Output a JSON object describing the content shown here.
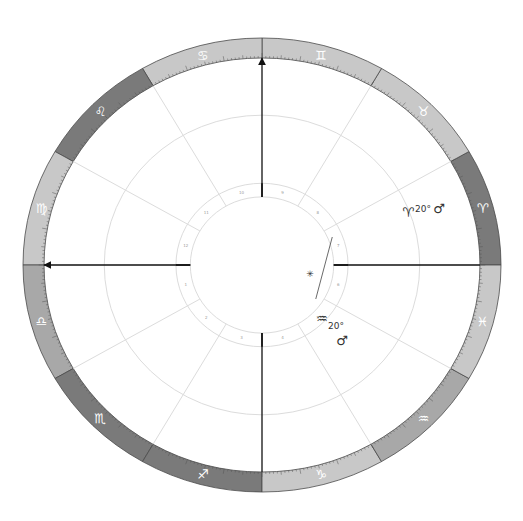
{
  "chart": {
    "center": {
      "x": 262,
      "y": 265
    },
    "outer_rx": 239,
    "outer_ry": 227,
    "ring_width": 20,
    "colors": {
      "light_sign": "#c8c8c8",
      "dark_sign": "#7a7a7a",
      "mid_sign": "#a8a8a8",
      "ring_border": "#4a4a4a",
      "house_line": "#dcdcdc",
      "circle_line": "#dcdcdc",
      "axis_line": "#111111",
      "glyph": "#ffffff"
    },
    "signs": [
      {
        "name": "Aries",
        "glyph": "♈",
        "start_deg": 0,
        "shade": "dark"
      },
      {
        "name": "Taurus",
        "glyph": "♉",
        "start_deg": 30,
        "shade": "light"
      },
      {
        "name": "Gemini",
        "glyph": "♊",
        "start_deg": 60,
        "shade": "light"
      },
      {
        "name": "Cancer",
        "glyph": "♋",
        "start_deg": 90,
        "shade": "light"
      },
      {
        "name": "Leo",
        "glyph": "♌",
        "start_deg": 120,
        "shade": "dark"
      },
      {
        "name": "Virgo",
        "glyph": "♍",
        "start_deg": 150,
        "shade": "light"
      },
      {
        "name": "Libra",
        "glyph": "♎",
        "start_deg": 180,
        "shade": "mid"
      },
      {
        "name": "Scorpio",
        "glyph": "♏",
        "start_deg": 210,
        "shade": "dark"
      },
      {
        "name": "Sagittarius",
        "glyph": "♐",
        "start_deg": 240,
        "shade": "dark"
      },
      {
        "name": "Capricorn",
        "glyph": "♑",
        "start_deg": 270,
        "shade": "light"
      },
      {
        "name": "Aquarius",
        "glyph": "♒",
        "start_deg": 300,
        "shade": "mid"
      },
      {
        "name": "Pisces",
        "glyph": "♓",
        "start_deg": 330,
        "shade": "light"
      }
    ],
    "houses": [
      {
        "num": "1",
        "deg": 180
      },
      {
        "num": "2",
        "deg": 210
      },
      {
        "num": "3",
        "deg": 240
      },
      {
        "num": "4",
        "deg": 270
      },
      {
        "num": "5",
        "deg": 300
      },
      {
        "num": "6",
        "deg": 330
      },
      {
        "num": "7",
        "deg": 0
      },
      {
        "num": "8",
        "deg": 30
      },
      {
        "num": "9",
        "deg": 60
      },
      {
        "num": "10",
        "deg": 90
      },
      {
        "num": "11",
        "deg": 120
      },
      {
        "num": "12",
        "deg": 150
      }
    ],
    "axes": [
      {
        "label": "MC",
        "deg": 90,
        "arrow": true
      },
      {
        "label": "ASC",
        "deg": 180,
        "arrow": true
      },
      {
        "label": "IC",
        "deg": 270,
        "arrow": false
      },
      {
        "label": "DSC",
        "deg": 0,
        "arrow": false
      }
    ],
    "planets": [
      {
        "name": "Mars",
        "sign_glyph": "♈",
        "degree": "20°",
        "planet_glyph": "♂",
        "x": 420,
        "y": 210
      },
      {
        "name": "Mars",
        "sign_glyph": "♒",
        "degree": "20°",
        "planet_glyph": "♂",
        "x": 330,
        "y": 320
      }
    ],
    "aspect_marker": {
      "glyph": "✳",
      "x": 310,
      "y": 274
    }
  }
}
